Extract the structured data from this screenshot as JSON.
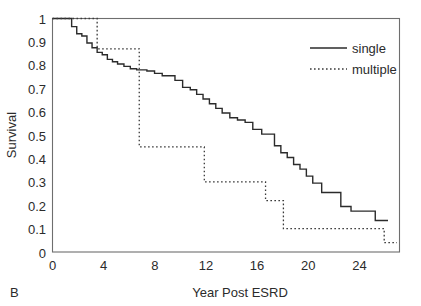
{
  "panel": {
    "label": "B"
  },
  "chart_data": {
    "type": "line",
    "title": "",
    "subtitle": "",
    "xlabel": "Year Post ESRD",
    "ylabel": "Survival",
    "xlim": [
      0,
      27.2
    ],
    "ylim": [
      0,
      1
    ],
    "xticks": [
      0,
      4,
      8,
      12,
      16,
      20,
      24
    ],
    "xtick_labels": [
      "0",
      "4",
      "8",
      "12",
      "16",
      "20",
      "24"
    ],
    "yticks": [
      0,
      0.1,
      0.2,
      0.3,
      0.4,
      0.5,
      0.6,
      0.7,
      0.8,
      0.9,
      1
    ],
    "ytick_labels": [
      "0",
      "0.1",
      "0.2",
      "0.3",
      "0.4",
      "0.5",
      "0.6",
      "0.7",
      "0.8",
      "0.9",
      "1"
    ],
    "grid": false,
    "legend_position": "top-right",
    "series": [
      {
        "name": "single",
        "style": "solid",
        "color": "#2b2b2b",
        "x": [
          0,
          1.5,
          1.5,
          1.9,
          1.9,
          2.3,
          2.3,
          2.7,
          2.7,
          3.1,
          3.1,
          3.5,
          3.5,
          3.9,
          3.9,
          4.3,
          4.3,
          4.7,
          4.7,
          5.1,
          5.1,
          5.6,
          5.6,
          6.1,
          6.1,
          6.6,
          6.6,
          7.4,
          7.4,
          8.0,
          8.0,
          8.6,
          8.6,
          9.6,
          9.6,
          10.2,
          10.2,
          10.8,
          10.8,
          11.3,
          11.3,
          11.8,
          11.8,
          12.3,
          12.3,
          12.8,
          12.8,
          13.3,
          13.3,
          13.9,
          13.9,
          14.5,
          14.5,
          15.1,
          15.1,
          15.7,
          15.7,
          16.4,
          16.4,
          17.4,
          17.4,
          17.9,
          17.9,
          18.4,
          18.4,
          18.9,
          18.9,
          19.4,
          19.4,
          19.9,
          19.9,
          20.4,
          20.4,
          21.1,
          21.1,
          22.6,
          22.6,
          23.4,
          23.4,
          25.3,
          25.3,
          26.3
        ],
        "y": [
          1.0,
          1.0,
          0.965,
          0.965,
          0.935,
          0.935,
          0.925,
          0.925,
          0.895,
          0.895,
          0.875,
          0.875,
          0.855,
          0.855,
          0.845,
          0.845,
          0.825,
          0.825,
          0.815,
          0.815,
          0.805,
          0.805,
          0.795,
          0.795,
          0.785,
          0.785,
          0.78,
          0.78,
          0.775,
          0.775,
          0.765,
          0.765,
          0.755,
          0.755,
          0.735,
          0.735,
          0.705,
          0.705,
          0.695,
          0.695,
          0.675,
          0.675,
          0.655,
          0.655,
          0.635,
          0.635,
          0.615,
          0.615,
          0.595,
          0.595,
          0.575,
          0.575,
          0.565,
          0.565,
          0.555,
          0.555,
          0.525,
          0.525,
          0.505,
          0.505,
          0.455,
          0.455,
          0.425,
          0.425,
          0.405,
          0.405,
          0.375,
          0.375,
          0.355,
          0.355,
          0.325,
          0.325,
          0.295,
          0.295,
          0.255,
          0.255,
          0.195,
          0.195,
          0.175,
          0.175,
          0.135,
          0.135
        ],
        "final_value": 0.135
      },
      {
        "name": "multiple",
        "style": "dotted",
        "color": "#3a3a3a",
        "x": [
          0,
          3.5,
          3.5,
          6.8,
          6.8,
          11.9,
          11.9,
          16.7,
          16.7,
          18.1,
          18.1,
          26.0,
          26.0,
          27.0
        ],
        "y": [
          1.0,
          1.0,
          0.87,
          0.87,
          0.45,
          0.45,
          0.3,
          0.3,
          0.22,
          0.22,
          0.1,
          0.1,
          0.04,
          0.04
        ],
        "final_value": 0.04
      }
    ],
    "legend": [
      {
        "label": "single",
        "style": "solid"
      },
      {
        "label": "multiple",
        "style": "dotted"
      }
    ]
  }
}
